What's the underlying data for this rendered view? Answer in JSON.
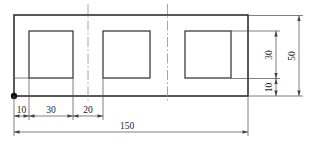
{
  "drawing": {
    "type": "technical-dimension-drawing",
    "background_color": "#ffffff",
    "line_color": "#2f2f2f",
    "dimension_line_color": "#555555",
    "labels": {
      "bottom": {
        "left_margin": "10",
        "hole_width": "30",
        "hole_spacing": "20",
        "overall_length": "150"
      },
      "right": {
        "hole_height": "30",
        "bottom_offset": "10",
        "overall_height": "50"
      }
    }
  }
}
